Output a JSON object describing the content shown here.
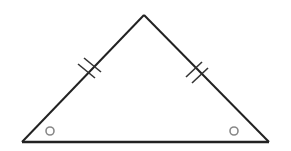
{
  "diagram": {
    "type": "isosceles-triangle",
    "background": "#ffffff",
    "stroke_color": "#222222",
    "mark_color": "#888888",
    "vertices": {
      "apex": [
        144,
        15
      ],
      "bottom_left": [
        22,
        142
      ],
      "bottom_right": [
        269,
        142
      ]
    },
    "congruent_side_marks": [
      {
        "side": "left",
        "count": 2
      },
      {
        "side": "right",
        "count": 2
      }
    ],
    "congruent_angle_marks": [
      {
        "vertex": "bottom_left",
        "symbol": "circle",
        "center": [
          50,
          131
        ],
        "r": 4
      },
      {
        "vertex": "bottom_right",
        "symbol": "circle",
        "center": [
          234,
          131
        ],
        "r": 4
      }
    ]
  }
}
